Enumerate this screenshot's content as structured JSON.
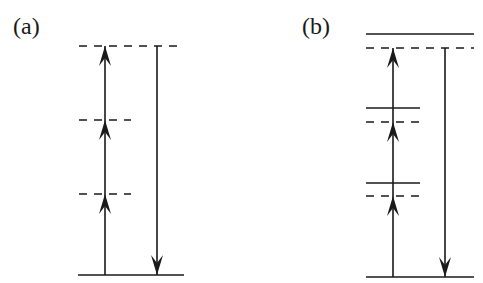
{
  "figure": {
    "panels": [
      {
        "id": "a",
        "label": "(a)",
        "description": "Three-photon excitation via virtual (dashed) intermediate levels, single downward emission",
        "ground_level": {
          "y": 275,
          "x1": 78,
          "x2": 184,
          "style": "solid"
        },
        "levels": [
          {
            "y": 46,
            "x1": 79,
            "x2": 184,
            "style": "dashed"
          },
          {
            "y": 120,
            "x1": 79,
            "x2": 131,
            "style": "dashed"
          },
          {
            "y": 194,
            "x1": 79,
            "x2": 131,
            "style": "dashed"
          }
        ],
        "up_arrows": {
          "x": 105,
          "segments": [
            [
              275,
              194
            ],
            [
              194,
              120
            ],
            [
              120,
              46
            ]
          ]
        },
        "down_arrow": {
          "x": 157,
          "from": 46,
          "to": 275
        }
      },
      {
        "id": "b",
        "label": "(b)",
        "description": "Three-photon excitation with real (solid) levels slightly above virtual (dashed) levels, single downward emission",
        "ground_level": {
          "y": 277,
          "x1": 366,
          "x2": 474,
          "style": "solid"
        },
        "levels": [
          {
            "y": 34,
            "x1": 366,
            "x2": 474,
            "style": "solid"
          },
          {
            "y": 48,
            "x1": 366,
            "x2": 474,
            "style": "dashed"
          },
          {
            "y": 108,
            "x1": 366,
            "x2": 420,
            "style": "solid"
          },
          {
            "y": 122,
            "x1": 366,
            "x2": 420,
            "style": "dashed"
          },
          {
            "y": 183,
            "x1": 366,
            "x2": 420,
            "style": "solid"
          },
          {
            "y": 196,
            "x1": 366,
            "x2": 420,
            "style": "dashed"
          }
        ],
        "up_arrows": {
          "x": 393,
          "segments": [
            [
              277,
              196
            ],
            [
              196,
              122
            ],
            [
              122,
              48
            ]
          ]
        },
        "down_arrow": {
          "x": 445,
          "from": 48,
          "to": 277
        }
      }
    ],
    "colors": {
      "line": "#1a1a1a",
      "background": "#ffffff"
    }
  }
}
